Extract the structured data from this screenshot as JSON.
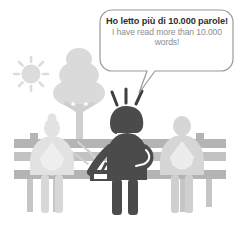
{
  "illustration": {
    "title": "Park bench reading achievement illustration",
    "background_color": "#ffffff"
  },
  "speech_bubble": {
    "name": "speech-bubble",
    "italian_text": "Ho letto più di 10.000 parole!",
    "english_text": "I have read more than 10.000 words!",
    "outline_color": "#9a9a9a",
    "fill_color": "#ffffff",
    "italian_text_color": "#2f2f2f",
    "english_text_color": "#8d8d8d",
    "tail_direction": "down-left"
  },
  "scene": {
    "sun": {
      "label": "sun",
      "color": "#dcdcdc",
      "ray_count": 8
    },
    "tree": {
      "label": "tree",
      "foliage_color": "#dadada",
      "trunk_color": "#cfcfcf"
    },
    "bench": {
      "label": "park-bench",
      "color": "#b4b4b4",
      "slat_color": "#c2c2c2"
    },
    "figures": [
      {
        "label": "seated-person-left",
        "color": "#e2e2e2",
        "pose": "seated",
        "hair": "bun"
      },
      {
        "label": "standing-person-center",
        "color": "#4b4b4b",
        "pose": "standing",
        "hair": "bob",
        "excited": true,
        "motion_line_count": 3
      },
      {
        "label": "seated-person-right",
        "color": "#d6d6d6",
        "pose": "seated",
        "hair": "round"
      }
    ],
    "bag": {
      "label": "briefcase",
      "color": "#4b4b4b"
    }
  },
  "colors": {
    "dark": "#4b4b4b",
    "mid_gray": "#b4b4b4",
    "light_gray": "#dadada",
    "pale_gray": "#e4e4e4",
    "outline": "#9a9a9a"
  }
}
